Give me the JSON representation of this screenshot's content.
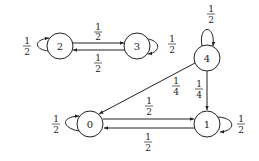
{
  "diagram": {
    "type": "markov-chain",
    "nodes": [
      {
        "id": "0",
        "label": "0",
        "x": 90,
        "y": 124
      },
      {
        "id": "1",
        "label": "1",
        "x": 207,
        "y": 124
      },
      {
        "id": "2",
        "label": "2",
        "x": 60,
        "y": 46
      },
      {
        "id": "3",
        "label": "3",
        "x": 137,
        "y": 46
      },
      {
        "id": "4",
        "label": "4",
        "x": 207,
        "y": 58
      }
    ],
    "edges": [
      {
        "from": "2",
        "to": "2",
        "num": "1",
        "den": "2"
      },
      {
        "from": "2",
        "to": "3",
        "num": "1",
        "den": "2"
      },
      {
        "from": "3",
        "to": "2",
        "num": "1",
        "den": "2"
      },
      {
        "from": "3",
        "to": "3",
        "num": "1",
        "den": "2"
      },
      {
        "from": "4",
        "to": "4",
        "num": "1",
        "den": "2"
      },
      {
        "from": "4",
        "to": "0",
        "num": "1",
        "den": "4"
      },
      {
        "from": "4",
        "to": "1",
        "num": "1",
        "den": "4"
      },
      {
        "from": "0",
        "to": "0",
        "num": "1",
        "den": "2"
      },
      {
        "from": "0",
        "to": "1",
        "num": "1",
        "den": "2"
      },
      {
        "from": "1",
        "to": "0",
        "num": "1",
        "den": "2"
      },
      {
        "from": "1",
        "to": "1",
        "num": "1",
        "den": "2"
      }
    ]
  },
  "labels": {
    "n0": "0",
    "n1": "1",
    "n2": "2",
    "n3": "3",
    "n4": "4",
    "e22": {
      "num": "1",
      "den": "2"
    },
    "e23": {
      "num": "1",
      "den": "2"
    },
    "e32": {
      "num": "1",
      "den": "2"
    },
    "e33": {
      "num": "1",
      "den": "2"
    },
    "e44": {
      "num": "1",
      "den": "2"
    },
    "e40": {
      "num": "1",
      "den": "4"
    },
    "e41": {
      "num": "1",
      "den": "4"
    },
    "e00": {
      "num": "1",
      "den": "2"
    },
    "e01": {
      "num": "1",
      "den": "2"
    },
    "e10": {
      "num": "1",
      "den": "2"
    },
    "e11": {
      "num": "1",
      "den": "2"
    }
  }
}
